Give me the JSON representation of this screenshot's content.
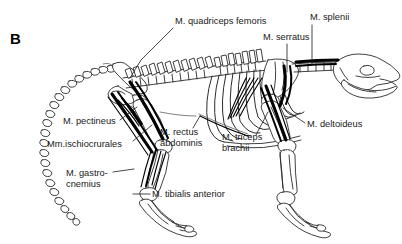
{
  "figure": {
    "panel_letter": "B",
    "background_color": "#ffffff",
    "line_color": "#2b2b2b",
    "muscle_color": "#000000",
    "text_color": "#1a1a1a",
    "width": 402,
    "height": 244,
    "view": "lateral"
  },
  "annotations": [
    {
      "id": "quadriceps-femoris",
      "label": "M. quadriceps femoris",
      "lines": [
        "M. quadriceps femoris"
      ],
      "text_x": 175,
      "text_y": 24,
      "anchor": "start",
      "leader": "M 173 28 L 141 60 L 130 78",
      "target": "lumbar-spine"
    },
    {
      "id": "splenii",
      "label": "M. splenii",
      "lines": [
        "M. splenii"
      ],
      "text_x": 310,
      "text_y": 20,
      "anchor": "start",
      "leader": "M 312 25 L 312 64",
      "target": "cervical-neck"
    },
    {
      "id": "serratus",
      "label": "M. serratus",
      "lines": [
        "M. serratus"
      ],
      "text_x": 263,
      "text_y": 40,
      "anchor": "start",
      "leader": "M 287 44 L 287 72",
      "target": "scapula-serratus"
    },
    {
      "id": "deltoideus",
      "label": "M. deltoideus",
      "lines": [
        "M. deltoideus"
      ],
      "text_x": 307,
      "text_y": 127,
      "anchor": "start",
      "leader": "M 305 123 L 283 108",
      "target": "shoulder-deltoid"
    },
    {
      "id": "pectineus",
      "label": "M. pectineus",
      "lines": [
        "M. pectineus"
      ],
      "text_x": 63,
      "text_y": 124,
      "anchor": "start",
      "leader": "M 120 120 L 137 107",
      "target": "pelvis-pectineus"
    },
    {
      "id": "ischiocrurales",
      "label": "Mm.ischiocrurales",
      "lines": [
        "Mm.ischiocrurales"
      ],
      "text_x": 47,
      "text_y": 147,
      "anchor": "start",
      "leader": "M 133 141 L 152 125",
      "target": "hamstring-group"
    },
    {
      "id": "rectus-abdominis",
      "label": "M. rectus abdominis",
      "lines": [
        "M. rectus",
        "abdominis"
      ],
      "text_x": 160,
      "text_y": 135,
      "anchor": "start",
      "leader": "M 193 128 L 200 116",
      "target": "ventral-abdomen"
    },
    {
      "id": "triceps-brachii",
      "label": "M. triceps brachii",
      "lines": [
        "M. triceps",
        "brachii"
      ],
      "text_x": 222,
      "text_y": 140,
      "anchor": "start",
      "leader": "M 256 135 L 268 112",
      "target": "humerus-triceps"
    },
    {
      "id": "gastrocnemius",
      "label": "M. gastro- cnemius",
      "lines": [
        "M. gastro-",
        "cnemius"
      ],
      "text_x": 66,
      "text_y": 176,
      "anchor": "start",
      "leader": "M 113 172 L 134 169",
      "target": "calf-gastrocnemius"
    },
    {
      "id": "tibialis-anterior",
      "label": "M. tibialis anterior",
      "lines": [
        "M. tibialis anterior"
      ],
      "text_x": 152,
      "text_y": 197,
      "anchor": "start",
      "leader": "M 150 194 L 133 194",
      "target": "shank-tibialis"
    }
  ],
  "skeleton": {
    "regions": [
      "skull",
      "cervical-vertebrae",
      "thoracic-vertebrae",
      "ribcage",
      "lumbar-vertebrae",
      "sacrum",
      "caudal-vertebrae-tail",
      "pelvis",
      "femur",
      "tibia-fibula",
      "hind-foot",
      "scapula",
      "humerus",
      "radius-ulna",
      "fore-foot"
    ]
  }
}
